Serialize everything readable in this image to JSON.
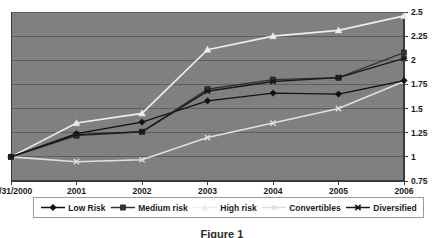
{
  "chart_data": {
    "type": "line",
    "title": "",
    "xlabel": "",
    "ylabel": "",
    "categories": [
      "12/31/2000",
      "2001",
      "2002",
      "2003",
      "2004",
      "2005",
      "2006"
    ],
    "ylim": [
      0.75,
      2.5
    ],
    "ytick_values": [
      0.75,
      1,
      1.25,
      1.5,
      1.75,
      2,
      2.25,
      2.5
    ],
    "ytick_labels": [
      "0.75",
      "1",
      "1.25",
      "1.5",
      "1.75",
      "2",
      "2.25",
      "2.5"
    ],
    "yaxis_position": "right",
    "grid": true,
    "grid_axis": "y",
    "legend_position": "bottom",
    "plot_background": "#808080",
    "series": [
      {
        "name": "Low Risk",
        "marker": "diamond",
        "color": "#111111",
        "values": [
          1.0,
          1.24,
          1.36,
          1.58,
          1.66,
          1.65,
          1.79
        ]
      },
      {
        "name": "Medium risk",
        "marker": "square",
        "color": "#333333",
        "values": [
          1.0,
          1.22,
          1.26,
          1.7,
          1.8,
          1.82,
          2.08
        ]
      },
      {
        "name": "High risk",
        "marker": "triangle",
        "color": "#ededed",
        "values": [
          1.0,
          1.35,
          1.45,
          2.11,
          2.25,
          2.31,
          2.46
        ]
      },
      {
        "name": "Convertibles",
        "marker": "x",
        "color": "#e0e0e0",
        "values": [
          1.0,
          0.95,
          0.97,
          1.2,
          1.35,
          1.5,
          1.78
        ]
      },
      {
        "name": "Diversified",
        "marker": "star",
        "color": "#1a1a1a",
        "values": [
          1.0,
          1.23,
          1.26,
          1.68,
          1.78,
          1.82,
          2.02
        ]
      }
    ]
  },
  "caption": "Figure 1"
}
